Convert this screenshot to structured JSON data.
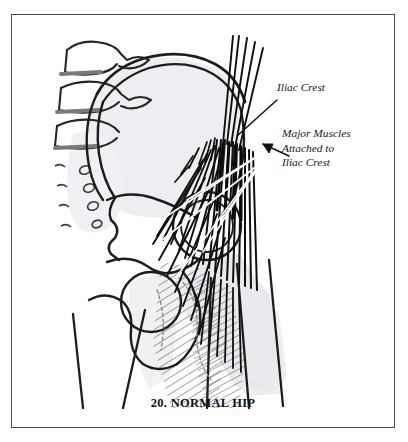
{
  "figure": {
    "caption": "20. NORMAL HIP",
    "number": "20",
    "title": "NORMAL HIP",
    "type": "anatomical-line-illustration",
    "border_color": "#4a4a4a",
    "background_color": "#ffffff",
    "ink_color": "#1a1a1a",
    "bone_fill_color": "#eceef1",
    "muscle_shade_color": "#e4e6ea",
    "pointer_line_color": "#ffffff"
  },
  "annotations": [
    {
      "id": "iliac-crest",
      "text": "Iliac Crest",
      "style": "italic-serif",
      "pointer": "leader-line",
      "points_to": "superior border of the ilium"
    },
    {
      "id": "major-muscles",
      "line1": "Major Muscles",
      "line2": "Attached to",
      "line3": "Iliac Crest",
      "style": "italic-serif",
      "pointer": "arrowhead",
      "points_to": "muscle fiber origins along the iliac crest"
    }
  ],
  "anatomy_parts": [
    "lumbar vertebrae",
    "intervertebral discs",
    "sacrum",
    "sacral foramina",
    "ilium",
    "iliac crest",
    "acetabulum",
    "femoral head",
    "greater trochanter",
    "obturator foramen",
    "superior pubic ramus",
    "inferior pubic ramus",
    "ischium",
    "ischial tuberosity",
    "femoral shaft",
    "gluteal muscle fibers",
    "thigh musculature"
  ]
}
